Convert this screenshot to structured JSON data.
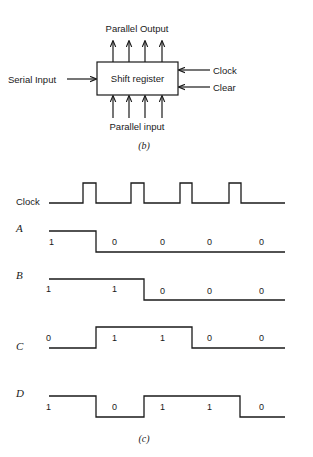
{
  "block_diagram": {
    "title_top": "Parallel Output",
    "box_label": "Shift register",
    "left_input": "Serial Input",
    "right_inputs": [
      "Clock",
      "Clear"
    ],
    "bottom_label": "Parallel input",
    "caption": "(b)",
    "output_arrow_count": 4,
    "input_arrow_count": 4
  },
  "timing_diagram": {
    "caption": "(c)",
    "signals": [
      {
        "name": "Clock",
        "italic": false,
        "pulses": 4
      },
      {
        "name": "A",
        "italic": true,
        "bits": [
          "1",
          "0",
          "0",
          "0",
          "0"
        ]
      },
      {
        "name": "B",
        "italic": true,
        "bits": [
          "1",
          "1",
          "0",
          "0",
          "0"
        ]
      },
      {
        "name": "C",
        "italic": true,
        "bits": [
          "0",
          "1",
          "1",
          "0",
          "0"
        ]
      },
      {
        "name": "D",
        "italic": true,
        "bits": [
          "1",
          "0",
          "1",
          "1",
          "0"
        ]
      }
    ]
  }
}
